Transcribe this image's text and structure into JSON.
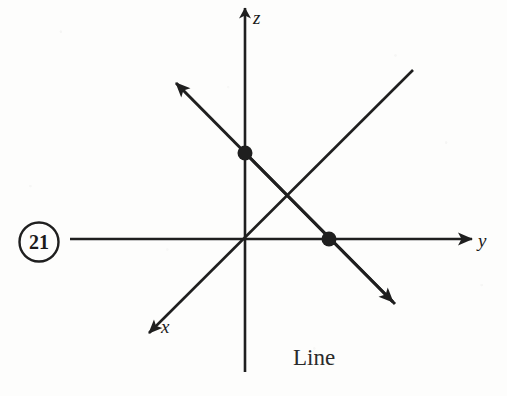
{
  "figure": {
    "problem_number": "21",
    "caption": "Line",
    "background_color": "#fdfdfc",
    "ink_color": "#1f1f1f",
    "width": 507,
    "height": 396,
    "axes": [
      {
        "name": "z",
        "label": "z",
        "label_x": 253,
        "label_y": 24,
        "direction": "up",
        "has_arrowhead": true,
        "from_x": 245,
        "from_y": 372,
        "to_x": 245,
        "to_y": 6
      },
      {
        "name": "y",
        "label": "y",
        "label_x": 478,
        "label_y": 247,
        "direction": "right",
        "has_arrowhead": true,
        "from_x": 70,
        "from_y": 239,
        "to_x": 474,
        "to_y": 239
      },
      {
        "name": "x",
        "label": "x",
        "label_x": 161,
        "label_y": 333,
        "direction": "down-left",
        "has_arrowhead": true,
        "from_x": 413,
        "from_y": 70,
        "to_x": 147,
        "to_y": 335
      }
    ],
    "line": {
      "name": "Line",
      "has_arrowhead_start": true,
      "has_arrowhead_end": true,
      "start_x": 174,
      "start_y": 81,
      "end_x": 397,
      "end_y": 306
    },
    "points": [
      {
        "name": "point-on-z-axis",
        "x": 245,
        "y": 153,
        "radius": 7
      },
      {
        "name": "point-on-y-axis",
        "x": 329,
        "y": 239,
        "radius": 7
      }
    ],
    "problem_badge": {
      "center_x": 39,
      "center_y": 242,
      "radius": 20
    }
  }
}
